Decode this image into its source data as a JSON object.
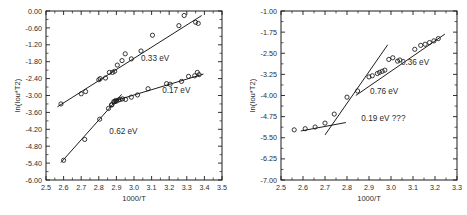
{
  "figure": {
    "background_color": "#ffffff",
    "ink_color": "#1c1c1c",
    "panel_count": 2
  },
  "chart_data": [
    {
      "id": "left-panel",
      "type": "scatter",
      "title": "",
      "xlabel": "1000/T",
      "ylabel": "ln(Iou*T2)",
      "xlim": [
        2.5,
        3.5
      ],
      "ylim": [
        -6.0,
        0.0
      ],
      "xticks": [
        "2.5",
        "2.6",
        "2.7",
        "2.8",
        "2.9",
        "3.0",
        "3.1",
        "3.2",
        "3.3",
        "3.4",
        "3.5"
      ],
      "xtick_values": [
        2.5,
        2.6,
        2.7,
        2.8,
        2.9,
        3.0,
        3.1,
        3.2,
        3.3,
        3.4,
        3.5
      ],
      "yticks": [
        "0.00",
        "-0.60",
        "-1.20",
        "-1.80",
        "-2.40",
        "-3.00",
        "-3.60",
        "-4.20",
        "-4.80",
        "-5.40",
        "-6.00"
      ],
      "ytick_values": [
        0.0,
        -0.6,
        -1.2,
        -1.8,
        -2.4,
        -3.0,
        -3.6,
        -4.2,
        -4.8,
        -5.4,
        -6.0
      ],
      "grid": false,
      "legend": "none",
      "annotations": [
        {
          "label": "0.33 eV",
          "x": 3.04,
          "y": -1.78
        },
        {
          "label": "0.17 eV",
          "x": 3.16,
          "y": -2.92
        },
        {
          "label": "0.62 eV",
          "x": 2.86,
          "y": -4.36
        }
      ],
      "series": [
        {
          "name": "upper-branch-0.33eV",
          "marker": "open-circle",
          "points": [
            {
              "x": 2.585,
              "y": -3.3
            },
            {
              "x": 2.7,
              "y": -2.94
            },
            {
              "x": 2.725,
              "y": -2.86
            },
            {
              "x": 2.8,
              "y": -2.44
            },
            {
              "x": 2.808,
              "y": -2.4
            },
            {
              "x": 2.838,
              "y": -2.38
            },
            {
              "x": 2.86,
              "y": -2.18
            },
            {
              "x": 2.878,
              "y": -2.18
            },
            {
              "x": 2.89,
              "y": -2.14
            },
            {
              "x": 2.905,
              "y": -1.92
            },
            {
              "x": 2.932,
              "y": -1.76
            },
            {
              "x": 2.95,
              "y": -1.52
            },
            {
              "x": 2.985,
              "y": -1.7
            },
            {
              "x": 3.04,
              "y": -1.42
            },
            {
              "x": 3.105,
              "y": -0.86
            },
            {
              "x": 3.255,
              "y": -0.52
            },
            {
              "x": 3.285,
              "y": -0.16
            },
            {
              "x": 3.35,
              "y": -0.4
            },
            {
              "x": 3.365,
              "y": -0.44
            }
          ]
        },
        {
          "name": "lower-branch-0.17eV",
          "marker": "open-circle",
          "points": [
            {
              "x": 2.875,
              "y": -3.32
            },
            {
              "x": 2.89,
              "y": -3.22
            },
            {
              "x": 2.9,
              "y": -3.2
            },
            {
              "x": 2.912,
              "y": -3.16
            },
            {
              "x": 2.922,
              "y": -3.14
            },
            {
              "x": 2.935,
              "y": -3.12
            },
            {
              "x": 2.952,
              "y": -3.14
            },
            {
              "x": 2.985,
              "y": -3.06
            },
            {
              "x": 3.02,
              "y": -2.98
            },
            {
              "x": 3.08,
              "y": -2.76
            },
            {
              "x": 3.185,
              "y": -2.58
            },
            {
              "x": 3.205,
              "y": -2.6
            },
            {
              "x": 3.27,
              "y": -2.5
            },
            {
              "x": 3.31,
              "y": -2.32
            },
            {
              "x": 3.345,
              "y": -2.3
            },
            {
              "x": 3.36,
              "y": -2.18
            },
            {
              "x": 3.37,
              "y": -2.26
            }
          ]
        },
        {
          "name": "steep-branch-0.62eV",
          "marker": "open-circle",
          "points": [
            {
              "x": 2.6,
              "y": -5.3
            },
            {
              "x": 2.72,
              "y": -4.56
            },
            {
              "x": 2.805,
              "y": -3.84
            },
            {
              "x": 2.855,
              "y": -3.46
            },
            {
              "x": 2.872,
              "y": -3.34
            },
            {
              "x": 2.885,
              "y": -3.22
            },
            {
              "x": 2.895,
              "y": -3.18
            }
          ]
        }
      ],
      "fit_lines": [
        {
          "name": "fit-0.33eV",
          "x1": 2.565,
          "y1": -3.4,
          "x2": 3.385,
          "y2": -0.16
        },
        {
          "name": "fit-0.17eV",
          "x1": 2.905,
          "y1": -3.16,
          "x2": 3.395,
          "y2": -2.24
        },
        {
          "name": "fit-0.62eV",
          "x1": 2.585,
          "y1": -5.38,
          "x2": 2.93,
          "y2": -2.96
        }
      ]
    },
    {
      "id": "right-panel",
      "type": "scatter",
      "title": "",
      "xlabel": "1000/T",
      "ylabel": "ln(Iou*T2)",
      "xlim": [
        2.5,
        3.3
      ],
      "ylim": [
        -7.0,
        -1.0
      ],
      "xticks": [
        "2.5",
        "2.6",
        "2.7",
        "2.8",
        "2.9",
        "3.0",
        "3.1",
        "3.2",
        "3.3"
      ],
      "xtick_values": [
        2.5,
        2.6,
        2.7,
        2.8,
        2.9,
        3.0,
        3.1,
        3.2,
        3.3
      ],
      "yticks": [
        "-1.00",
        "-1.75",
        "-2.50",
        "-3.25",
        "-4.00",
        "-4.75",
        "-5.50",
        "-6.25",
        "-7.00"
      ],
      "ytick_values": [
        -1.0,
        -1.75,
        -2.5,
        -3.25,
        -4.0,
        -4.75,
        -5.5,
        -6.25,
        -7.0
      ],
      "grid": false,
      "legend": "none",
      "annotations": [
        {
          "label": "0.36 eV",
          "x": 3.045,
          "y": -2.92
        },
        {
          "label": "0.76 eV",
          "x": 2.905,
          "y": -3.96
        },
        {
          "label": "0.19 eV ???",
          "x": 2.865,
          "y": -4.9
        }
      ],
      "series": [
        {
          "name": "main-branch",
          "marker": "open-circle",
          "points": [
            {
              "x": 2.56,
              "y": -5.22
            },
            {
              "x": 2.61,
              "y": -5.18
            },
            {
              "x": 2.655,
              "y": -5.12
            },
            {
              "x": 2.7,
              "y": -4.98
            },
            {
              "x": 2.742,
              "y": -4.66
            },
            {
              "x": 2.8,
              "y": -4.06
            },
            {
              "x": 2.848,
              "y": -3.84
            },
            {
              "x": 2.9,
              "y": -3.34
            },
            {
              "x": 2.915,
              "y": -3.3
            },
            {
              "x": 2.938,
              "y": -3.22
            },
            {
              "x": 2.948,
              "y": -3.18
            },
            {
              "x": 2.96,
              "y": -3.14
            },
            {
              "x": 2.972,
              "y": -3.1
            },
            {
              "x": 2.99,
              "y": -2.72
            },
            {
              "x": 3.008,
              "y": -2.66
            },
            {
              "x": 3.03,
              "y": -2.78
            },
            {
              "x": 3.04,
              "y": -2.74
            },
            {
              "x": 3.108,
              "y": -2.36
            },
            {
              "x": 3.135,
              "y": -2.22
            },
            {
              "x": 3.155,
              "y": -2.18
            },
            {
              "x": 3.175,
              "y": -2.12
            },
            {
              "x": 3.195,
              "y": -2.06
            },
            {
              "x": 3.215,
              "y": -1.98
            }
          ]
        }
      ],
      "fit_lines": [
        {
          "name": "fit-0.36eV",
          "x1": 2.84,
          "y1": -4.0,
          "x2": 3.245,
          "y2": -1.82
        },
        {
          "name": "fit-0.76eV",
          "x1": 2.7,
          "y1": -5.4,
          "x2": 2.985,
          "y2": -2.2
        },
        {
          "name": "fit-0.19eV",
          "x1": 2.59,
          "y1": -5.26,
          "x2": 2.795,
          "y2": -4.96
        }
      ]
    }
  ]
}
